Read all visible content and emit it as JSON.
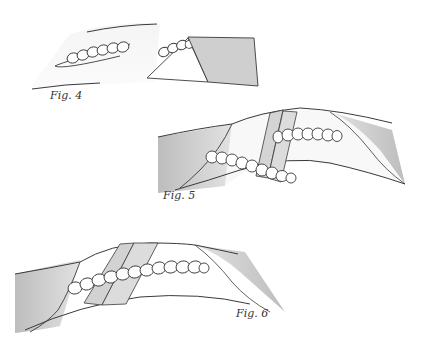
{
  "figures": [
    {
      "id": "fig4",
      "label": "Fig. 4",
      "label_pos": [
        50,
        89
      ]
    },
    {
      "id": "fig5",
      "label": "Fig. 5",
      "label_pos": [
        163,
        189
      ]
    },
    {
      "id": "fig6",
      "label": "Fig. 6",
      "label_pos": [
        236,
        307
      ]
    }
  ],
  "colors": {
    "line": "#3a3a3a",
    "shade": "#c8c8c8",
    "tape": "#d6d6d6",
    "background": "#ffffff"
  }
}
